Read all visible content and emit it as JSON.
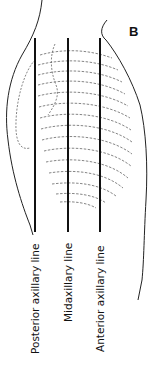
{
  "figure": {
    "panel_label": "B",
    "lines": [
      {
        "label": "Posterior axillary line",
        "x": 35
      },
      {
        "label": "Midaxillary line",
        "x": 68
      },
      {
        "label": "Anterior axillary line",
        "x": 100
      }
    ],
    "colors": {
      "line": "#111111",
      "outline": "#222222",
      "ribs": "#555555"
    }
  }
}
